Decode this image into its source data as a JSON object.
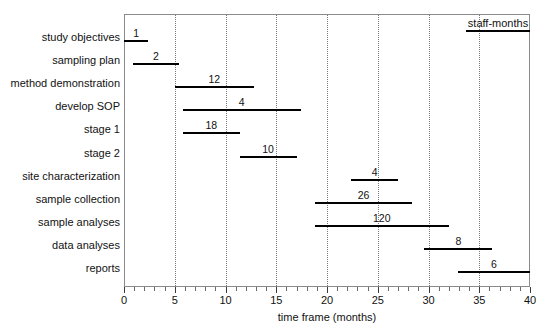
{
  "chart_data": {
    "type": "bar",
    "orientation": "horizontal",
    "style": "gantt-timeline",
    "title": "",
    "xlabel": "time frame (months)",
    "ylabel": "",
    "xlim": [
      0,
      40
    ],
    "xticks": [
      0,
      5,
      10,
      15,
      20,
      25,
      30,
      35,
      40
    ],
    "xtick_labels": [
      "0",
      "5",
      "10",
      "15",
      "20",
      "25",
      "30",
      "35",
      "40"
    ],
    "minor_tick_interval": 1,
    "grid": "vertical dotted at 5,10,15,20,25,30,35",
    "gridlines": [
      5,
      10,
      15,
      20,
      25,
      30,
      35
    ],
    "legend": {
      "position": "top-right-inside",
      "label": "staff-months",
      "symbol": "horizontal-line"
    },
    "value_unit": "staff-months",
    "categories": [
      "study objectives",
      "sampling plan",
      "method demonstration",
      "develop SOP",
      "stage 1",
      "stage 2",
      "site characterization",
      "sample collection",
      "sample analyses",
      "data analyses",
      "reports"
    ],
    "tasks": [
      {
        "label": "study objectives",
        "start": 0.0,
        "end": 2.4,
        "value": 1,
        "value_text": "1"
      },
      {
        "label": "sampling plan",
        "start": 0.9,
        "end": 5.4,
        "value": 2,
        "value_text": "2"
      },
      {
        "label": "method demonstration",
        "start": 5.0,
        "end": 12.8,
        "value": 12,
        "value_text": "12"
      },
      {
        "label": "develop SOP",
        "start": 5.8,
        "end": 17.4,
        "value": 4,
        "value_text": "4"
      },
      {
        "label": "stage 1",
        "start": 5.8,
        "end": 11.4,
        "value": 18,
        "value_text": "18"
      },
      {
        "label": "stage 2",
        "start": 11.4,
        "end": 17.0,
        "value": 10,
        "value_text": "10"
      },
      {
        "label": "site characterization",
        "start": 22.4,
        "end": 27.0,
        "value": 4,
        "value_text": "4"
      },
      {
        "label": "sample collection",
        "start": 18.8,
        "end": 28.4,
        "value": 26,
        "value_text": "26"
      },
      {
        "label": "sample analyses",
        "start": 18.8,
        "end": 32.0,
        "value": 120,
        "value_text": "120"
      },
      {
        "label": "data analyses",
        "start": 29.6,
        "end": 36.3,
        "value": 8,
        "value_text": "8"
      },
      {
        "label": "reports",
        "start": 32.9,
        "end": 40.0,
        "value": 6,
        "value_text": "6"
      }
    ],
    "colors": {
      "bar": "#000000",
      "frame": "#8a8a8a",
      "grid": "#7a7a7a",
      "text": "#111111",
      "background": "#ffffff"
    }
  }
}
